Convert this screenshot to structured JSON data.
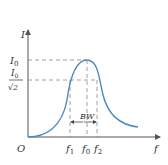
{
  "diagram": {
    "type": "resonance-curve",
    "axes": {
      "y_label": "I",
      "x_label": "f",
      "origin_label": "O"
    },
    "levels": {
      "peak_label": "I",
      "peak_sub": "0",
      "half_power_num": "I",
      "half_power_num_sub": "0",
      "half_power_den": "√2"
    },
    "x_ticks": [
      {
        "label": "f",
        "sub": "1"
      },
      {
        "label": "f",
        "sub": "0"
      },
      {
        "label": "f",
        "sub": "2"
      }
    ],
    "bandwidth_label": "BW",
    "colors": {
      "curve": "#4a8ac4",
      "axes": "#555555",
      "dashed": "#888888"
    }
  }
}
